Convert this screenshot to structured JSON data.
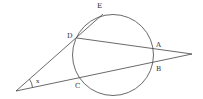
{
  "diagram": {
    "type": "geometry",
    "circle": {
      "cx": 113,
      "cy": 55,
      "r": 40.5
    },
    "points": {
      "P": {
        "x": 16,
        "y": 91
      },
      "Q": {
        "x": 192,
        "y": 54
      },
      "D": {
        "x": 77,
        "y": 38
      },
      "E": {
        "x": 103,
        "y": 14
      },
      "A": {
        "x": 153.5,
        "y": 49
      },
      "B": {
        "x": 153,
        "y": 62
      },
      "C": {
        "x": 80,
        "y": 77
      }
    },
    "labels": {
      "E": "E",
      "D": "D",
      "A": "A",
      "B": "B",
      "C": "C",
      "angle": "x"
    },
    "colors": {
      "stroke": "#444444",
      "text": "#333333",
      "background": "#ffffff"
    }
  }
}
